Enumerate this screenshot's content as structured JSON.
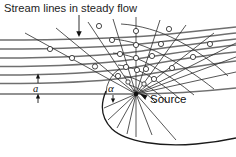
{
  "figure": {
    "title": "Stream lines in steady flow",
    "labels": {
      "source": "Source",
      "spacing": "a",
      "angle": "α"
    },
    "colors": {
      "streamline": "#6f6f6f",
      "ray": "#2b2b2b",
      "wavefront": "#2b2b2b",
      "envelope": "#1a1a1a",
      "node_fill": "#ffffff",
      "text": "#1a1a1a",
      "background": "#ffffff"
    },
    "geometry": {
      "source_point": [
        136,
        94
      ],
      "streamline_y": [
        40,
        49,
        58,
        66.5,
        75,
        83.5,
        94
      ],
      "ray_count": 18,
      "wavefront_count": 7,
      "dimension_label_between_y": [
        83.5,
        94
      ]
    },
    "annotations": [
      {
        "name": "title-pointer-arrow",
        "from": [
          79,
          14
        ],
        "to": [
          79,
          35
        ]
      },
      {
        "name": "source-pointer-arrow",
        "from": [
          153,
          98
        ],
        "to": [
          140,
          94
        ]
      },
      {
        "name": "angle-arc",
        "center": [
          136,
          94
        ],
        "radius": 30
      },
      {
        "name": "spacing-dimension",
        "x": 38,
        "y_top": 83.5,
        "y_bottom": 94
      }
    ]
  }
}
